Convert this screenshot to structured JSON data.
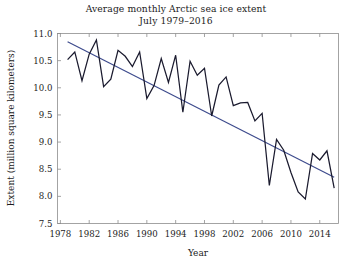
{
  "chart_data": {
    "type": "line",
    "title": "Average monthly Arctic sea ice extent",
    "subtitle": "July 1979–2016",
    "title_line1": "Average monthly Arctic sea ice extent",
    "title_line2": "July 1979–2016",
    "xlabel": "Year",
    "ylabel": "Extent (million square kilometers)",
    "xlim": [
      1977.6,
      2016.6
    ],
    "ylim": [
      7.5,
      11.0
    ],
    "grid": false,
    "legend": "none",
    "xticks": [
      1978,
      1982,
      1986,
      1990,
      1994,
      1998,
      2002,
      2006,
      2010,
      2014
    ],
    "xtick_labels": [
      "1978",
      "1982",
      "1986",
      "1990",
      "1994",
      "1998",
      "2002",
      "2006",
      "2010",
      "2014"
    ],
    "yticks": [
      7.5,
      8.0,
      8.5,
      9.0,
      9.5,
      10.0,
      10.5,
      11.0
    ],
    "ytick_labels": [
      "7.5",
      "8.0",
      "8.5",
      "9.0",
      "9.5",
      "10.0",
      "10.5",
      "11.0"
    ],
    "series": [
      {
        "name": "Average monthly Arctic sea ice extent (July)",
        "type": "line",
        "color": "#1a1a2e",
        "x": [
          1979,
          1980,
          1981,
          1982,
          1983,
          1984,
          1985,
          1986,
          1987,
          1988,
          1989,
          1990,
          1991,
          1992,
          1993,
          1994,
          1995,
          1996,
          1997,
          1998,
          1999,
          2000,
          2001,
          2002,
          2003,
          2004,
          2005,
          2006,
          2007,
          2008,
          2009,
          2010,
          2011,
          2012,
          2013,
          2014,
          2015,
          2016
        ],
        "values": [
          10.52,
          10.66,
          10.13,
          10.62,
          10.88,
          10.02,
          10.16,
          10.69,
          10.58,
          10.39,
          10.66,
          9.8,
          10.04,
          10.54,
          10.1,
          10.6,
          9.55,
          10.49,
          10.23,
          10.36,
          9.48,
          10.05,
          10.2,
          9.67,
          9.72,
          9.73,
          9.39,
          9.53,
          8.2,
          9.05,
          8.85,
          8.44,
          8.08,
          7.95,
          8.79,
          8.67,
          8.84,
          8.15
        ]
      },
      {
        "name": "Linear trend",
        "type": "trend",
        "color": "#3c4a8c",
        "x": [
          1979,
          2016
        ],
        "values": [
          10.85,
          8.35
        ]
      }
    ],
    "annotations": []
  },
  "colors": {
    "data_line": "#1a1a2e",
    "trend_line": "#3c4a8c",
    "axis": "#8d8d8d",
    "text": "#1c1c1c",
    "background": "#ffffff"
  }
}
